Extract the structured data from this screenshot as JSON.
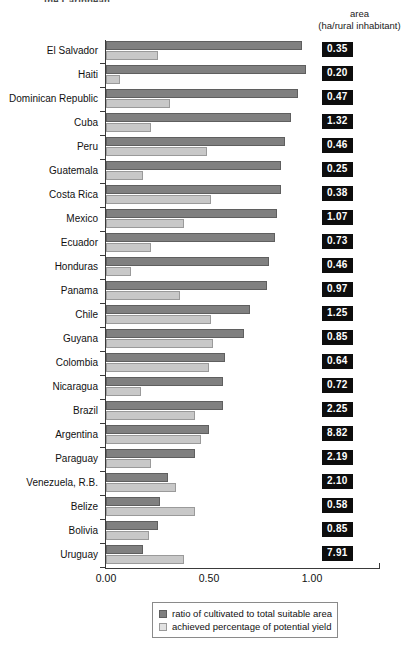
{
  "title_clipped": "the Caribbean",
  "header": {
    "line1": "area",
    "line2": "(ha/rural inhabitant)"
  },
  "legend": {
    "items": [
      {
        "label": "ratio of cultivated to total suitable area",
        "swatch": "dark-gray-swatch",
        "color": "#808080"
      },
      {
        "label": "achieved percentage of potential yield",
        "swatch": "light-gray-swatch",
        "color": "#e2e2e2"
      }
    ]
  },
  "axis": {
    "ticks": [
      "0.00",
      "0.50",
      "1.00"
    ],
    "tick_values": [
      0.0,
      0.5,
      1.0
    ]
  },
  "chart_data": {
    "type": "bar",
    "orientation": "horizontal",
    "title": "the Caribbean",
    "xlabel": "",
    "ylabel": "",
    "xlim": [
      0,
      1.33
    ],
    "grid": false,
    "legend_position": "bottom-center",
    "categories": [
      "El Salvador",
      "Haiti",
      "Dominican Republic",
      "Cuba",
      "Peru",
      "Guatemala",
      "Costa Rica",
      "Mexico",
      "Ecuador",
      "Honduras",
      "Panama",
      "Chile",
      "Guyana",
      "Colombia",
      "Nicaragua",
      "Brazil",
      "Argentina",
      "Paraguay",
      "Venezuela, R.B.",
      "Belize",
      "Bolivia",
      "Uruguay"
    ],
    "series": [
      {
        "name": "ratio of cultivated to total suitable area",
        "color": "#808080",
        "values": [
          0.95,
          0.97,
          0.93,
          0.9,
          0.87,
          0.85,
          0.85,
          0.83,
          0.82,
          0.79,
          0.78,
          0.7,
          0.67,
          0.58,
          0.57,
          0.57,
          0.5,
          0.43,
          0.3,
          0.26,
          0.25,
          0.18
        ]
      },
      {
        "name": "achieved percentage of potential yield",
        "color": "#c8c8c8",
        "values": [
          0.25,
          0.07,
          0.31,
          0.22,
          0.49,
          0.18,
          0.51,
          0.38,
          0.22,
          0.12,
          0.36,
          0.51,
          0.52,
          0.5,
          0.17,
          0.43,
          0.46,
          0.22,
          0.34,
          0.43,
          0.21,
          0.38
        ]
      }
    ],
    "area_labels": {
      "name": "area (ha/rural inhabitant)",
      "values": [
        "0.35",
        "0.20",
        "0.47",
        "1.32",
        "0.46",
        "0.25",
        "0.38",
        "1.07",
        "0.73",
        "0.46",
        "0.97",
        "1.25",
        "0.85",
        "0.64",
        "0.72",
        "2.25",
        "8.82",
        "2.19",
        "2.10",
        "0.58",
        "0.85",
        "7.91"
      ]
    }
  }
}
